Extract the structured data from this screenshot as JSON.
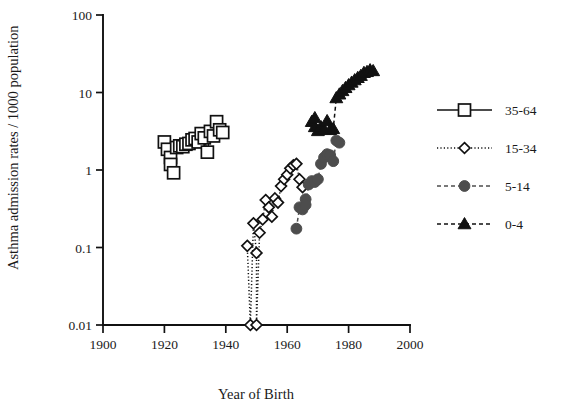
{
  "chart_data": {
    "type": "scatter",
    "title": "",
    "xlabel": "Year of Birth",
    "ylabel": "Asthma admission rates / 1000 population",
    "yscale": "log",
    "xlim": [
      1900,
      2000
    ],
    "ylim": [
      0.01,
      100
    ],
    "xticks": [
      1900,
      1920,
      1940,
      1960,
      1980,
      2000
    ],
    "xtick_labels": [
      "1900",
      "1920",
      "1940",
      "1960",
      "1980",
      "2000"
    ],
    "yticks": [
      0.01,
      0.1,
      1,
      10,
      100
    ],
    "ytick_labels": [
      "0.01",
      "0.1",
      "1",
      "10",
      "100"
    ],
    "grid": false,
    "legend_position": "right",
    "series": [
      {
        "name": "35-64",
        "marker": "square",
        "fill": "#ffffff",
        "stroke": "#111111",
        "line": "solid",
        "points": [
          {
            "x": 1920,
            "y": 2.3
          },
          {
            "x": 1921,
            "y": 1.85
          },
          {
            "x": 1922,
            "y": 1.45
          },
          {
            "x": 1922,
            "y": 1.18
          },
          {
            "x": 1923,
            "y": 0.92
          },
          {
            "x": 1924,
            "y": 1.95
          },
          {
            "x": 1925,
            "y": 2.05
          },
          {
            "x": 1926,
            "y": 2.0
          },
          {
            "x": 1927,
            "y": 2.15
          },
          {
            "x": 1928,
            "y": 2.2
          },
          {
            "x": 1929,
            "y": 2.45
          },
          {
            "x": 1930,
            "y": 2.55
          },
          {
            "x": 1931,
            "y": 2.3
          },
          {
            "x": 1932,
            "y": 2.95
          },
          {
            "x": 1933,
            "y": 2.6
          },
          {
            "x": 1934,
            "y": 1.7
          },
          {
            "x": 1935,
            "y": 3.15
          },
          {
            "x": 1936,
            "y": 2.75
          },
          {
            "x": 1937,
            "y": 4.2
          },
          {
            "x": 1938,
            "y": 3.3
          },
          {
            "x": 1939,
            "y": 3.05
          }
        ]
      },
      {
        "name": "15-34",
        "marker": "diamond",
        "fill": "#ffffff",
        "stroke": "#111111",
        "line": "dotted",
        "points": [
          {
            "x": 1947,
            "y": 0.105
          },
          {
            "x": 1948,
            "y": 0.01
          },
          {
            "x": 1949,
            "y": 0.205
          },
          {
            "x": 1950,
            "y": 0.085
          },
          {
            "x": 1950,
            "y": 0.01
          },
          {
            "x": 1951,
            "y": 0.155
          },
          {
            "x": 1952,
            "y": 0.23
          },
          {
            "x": 1953,
            "y": 0.41
          },
          {
            "x": 1954,
            "y": 0.33
          },
          {
            "x": 1955,
            "y": 0.25
          },
          {
            "x": 1956,
            "y": 0.43
          },
          {
            "x": 1957,
            "y": 0.38
          },
          {
            "x": 1958,
            "y": 0.62
          },
          {
            "x": 1959,
            "y": 0.76
          },
          {
            "x": 1960,
            "y": 0.87
          },
          {
            "x": 1961,
            "y": 1.05
          },
          {
            "x": 1962,
            "y": 1.15
          },
          {
            "x": 1963,
            "y": 1.2
          },
          {
            "x": 1964,
            "y": 0.76
          },
          {
            "x": 1965,
            "y": 0.6
          }
        ]
      },
      {
        "name": "5-14",
        "marker": "circle",
        "fill": "#4d4d4d",
        "stroke": "#4d4d4d",
        "line": "dashed",
        "points": [
          {
            "x": 1963,
            "y": 0.175
          },
          {
            "x": 1964,
            "y": 0.33
          },
          {
            "x": 1965,
            "y": 0.31
          },
          {
            "x": 1966,
            "y": 0.42
          },
          {
            "x": 1966,
            "y": 0.355
          },
          {
            "x": 1967,
            "y": 0.65
          },
          {
            "x": 1968,
            "y": 0.72
          },
          {
            "x": 1969,
            "y": 0.7
          },
          {
            "x": 1970,
            "y": 0.76
          },
          {
            "x": 1971,
            "y": 1.2
          },
          {
            "x": 1972,
            "y": 1.45
          },
          {
            "x": 1973,
            "y": 1.6
          },
          {
            "x": 1974,
            "y": 1.55
          },
          {
            "x": 1975,
            "y": 1.3
          },
          {
            "x": 1976,
            "y": 2.4
          },
          {
            "x": 1977,
            "y": 2.25
          }
        ]
      },
      {
        "name": "0-4",
        "marker": "triangle",
        "fill": "#111111",
        "stroke": "#111111",
        "line": "dashed",
        "points": [
          {
            "x": 1968,
            "y": 4.2
          },
          {
            "x": 1969,
            "y": 3.6
          },
          {
            "x": 1969,
            "y": 4.7
          },
          {
            "x": 1970,
            "y": 3.2
          },
          {
            "x": 1971,
            "y": 3.6
          },
          {
            "x": 1972,
            "y": 3.35
          },
          {
            "x": 1973,
            "y": 4.3
          },
          {
            "x": 1974,
            "y": 3.3
          },
          {
            "x": 1975,
            "y": 3.4
          },
          {
            "x": 1976,
            "y": 8.5
          },
          {
            "x": 1977,
            "y": 9.5
          },
          {
            "x": 1978,
            "y": 10.5
          },
          {
            "x": 1979,
            "y": 11.5
          },
          {
            "x": 1980,
            "y": 12.5
          },
          {
            "x": 1981,
            "y": 13.5
          },
          {
            "x": 1982,
            "y": 14.5
          },
          {
            "x": 1983,
            "y": 15.5
          },
          {
            "x": 1984,
            "y": 16.5
          },
          {
            "x": 1985,
            "y": 18.0
          },
          {
            "x": 1986,
            "y": 18.5
          },
          {
            "x": 1987,
            "y": 19.5
          },
          {
            "x": 1988,
            "y": 19.0
          }
        ]
      }
    ]
  },
  "legend": {
    "entries": [
      {
        "label": "35-64"
      },
      {
        "label": "15-34"
      },
      {
        "label": "5-14"
      },
      {
        "label": "0-4"
      }
    ]
  },
  "colors": {
    "axis": "#111111",
    "square_series": "#111111",
    "diamond_series": "#111111",
    "circle_series": "#4d4d4d",
    "triangle_series": "#111111",
    "background": "#ffffff"
  }
}
